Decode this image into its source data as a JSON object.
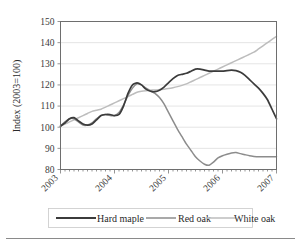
{
  "chart_data": {
    "type": "line",
    "title": "",
    "subtitle": "",
    "xlabel": "",
    "ylabel": "Index (2003=100)",
    "ylim": [
      80,
      150
    ],
    "xlim": [
      2003,
      2007
    ],
    "ytick_labels": [
      "150",
      "140",
      "130",
      "120",
      "110",
      "100",
      "90",
      "80"
    ],
    "ytick_values": [
      150,
      140,
      130,
      120,
      110,
      100,
      90,
      80
    ],
    "xtick_labels": [
      "2003",
      "2004",
      "2005",
      "2006",
      "2007"
    ],
    "xtick_values": [
      2003,
      2004,
      2005,
      2006,
      2007
    ],
    "grid": true,
    "grid_axis": "y",
    "legend_position": "bottom",
    "x": [
      2003.0,
      2003.083,
      2003.167,
      2003.25,
      2003.333,
      2003.417,
      2003.5,
      2003.583,
      2003.667,
      2003.75,
      2003.833,
      2003.917,
      2004.0,
      2004.083,
      2004.167,
      2004.25,
      2004.333,
      2004.417,
      2004.5,
      2004.583,
      2004.667,
      2004.75,
      2004.833,
      2004.917,
      2005.0,
      2005.083,
      2005.167,
      2005.25,
      2005.333,
      2005.417,
      2005.5,
      2005.583,
      2005.667,
      2005.75,
      2005.833,
      2005.917,
      2006.0,
      2006.083,
      2006.167,
      2006.25,
      2006.333,
      2006.417,
      2006.5,
      2006.583,
      2006.667,
      2006.75,
      2006.833,
      2006.917,
      2007.0
    ],
    "series": [
      {
        "name": "Hard maple",
        "color": "#3b3b3b",
        "width": 1.7,
        "values": [
          100.5,
          102.0,
          104.0,
          104.5,
          103.0,
          101.5,
          101.0,
          101.5,
          103.5,
          105.5,
          106.0,
          106.0,
          105.5,
          106.0,
          110.0,
          116.0,
          120.0,
          121.0,
          120.0,
          118.0,
          117.0,
          116.8,
          117.5,
          119.0,
          121.0,
          123.0,
          124.5,
          125.0,
          125.5,
          126.5,
          127.5,
          127.5,
          127.0,
          126.5,
          126.5,
          126.5,
          126.5,
          126.8,
          127.0,
          126.8,
          126.0,
          124.5,
          122.5,
          120.5,
          118.5,
          116.0,
          113.0,
          108.5,
          104.0
        ]
      },
      {
        "name": "Red oak",
        "color": "#8c8c8c",
        "width": 1.5,
        "values": [
          100.5,
          102.5,
          104.0,
          104.0,
          102.5,
          101.0,
          101.0,
          102.0,
          104.0,
          105.5,
          106.0,
          105.5,
          105.5,
          107.0,
          110.5,
          115.0,
          118.5,
          120.5,
          120.0,
          118.5,
          117.2,
          116.0,
          114.0,
          111.0,
          107.0,
          103.0,
          99.0,
          95.5,
          92.0,
          89.0,
          86.0,
          84.0,
          82.5,
          82.0,
          83.5,
          85.5,
          86.5,
          87.2,
          87.8,
          88.0,
          87.5,
          87.0,
          86.5,
          86.2,
          86.0,
          86.0,
          86.0,
          86.0,
          86.0
        ]
      },
      {
        "name": "White oak",
        "color": "#bdbdbd",
        "width": 1.5,
        "values": [
          100.5,
          101.5,
          102.5,
          103.5,
          104.5,
          105.5,
          106.5,
          107.5,
          108.0,
          108.5,
          109.5,
          110.5,
          111.5,
          112.5,
          113.5,
          114.5,
          115.5,
          116.5,
          117.0,
          117.3,
          117.5,
          117.6,
          117.8,
          118.0,
          118.3,
          118.7,
          119.2,
          119.8,
          120.5,
          121.5,
          122.5,
          123.5,
          124.5,
          125.5,
          126.5,
          127.5,
          128.5,
          129.5,
          130.5,
          131.5,
          132.5,
          133.5,
          134.5,
          135.5,
          137.0,
          138.5,
          140.0,
          141.5,
          143.0
        ]
      }
    ],
    "legend": [
      {
        "label": "Hard maple",
        "color": "#3b3b3b",
        "width": 1.9
      },
      {
        "label": "Red oak",
        "color": "#8c8c8c",
        "width": 1.5
      },
      {
        "label": "White oak",
        "color": "#bdbdbd",
        "width": 1.5
      }
    ]
  }
}
